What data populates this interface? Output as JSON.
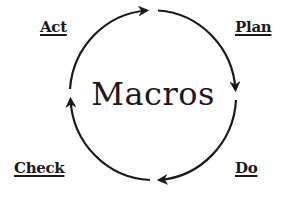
{
  "diagram": {
    "type": "cycle",
    "center_label": "Macros",
    "stages": [
      {
        "label": "Plan",
        "position": "top-right"
      },
      {
        "label": "Do",
        "position": "bottom-right"
      },
      {
        "label": "Check",
        "position": "bottom-left"
      },
      {
        "label": "Act",
        "position": "top-left"
      }
    ],
    "direction": "clockwise",
    "colors": {
      "stroke": "#1a1a1a",
      "background": "#ffffff"
    }
  }
}
